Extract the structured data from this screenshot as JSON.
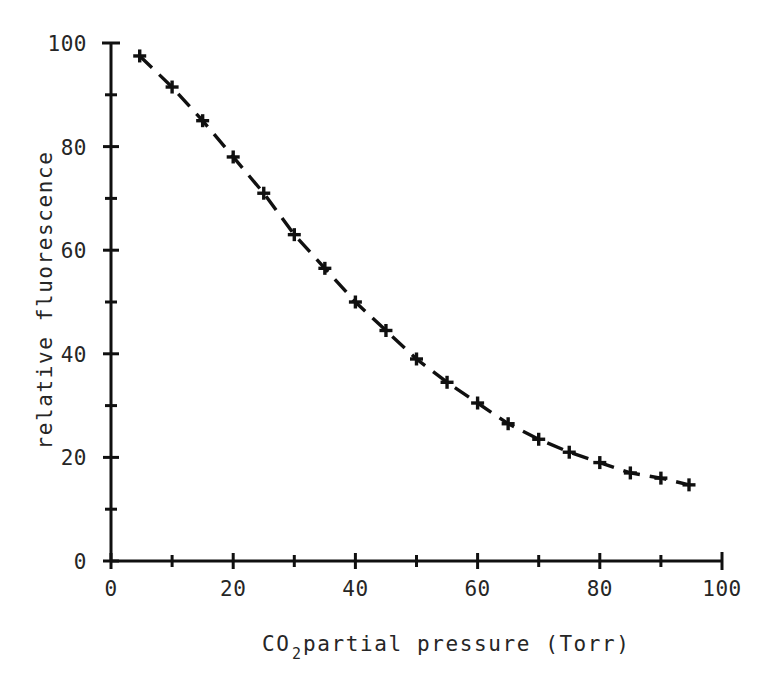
{
  "figure": {
    "background_color": "#ffffff",
    "ink_color": "#101010"
  },
  "chart_data": {
    "type": "line",
    "title": "",
    "subtitle": "",
    "xlabel": "CO2 partial pressure (Torr)",
    "xlabel_parts": {
      "base": "CO",
      "subscript": "2",
      "rest": " partial pressure  (Torr)"
    },
    "ylabel": "relative fluorescence",
    "xlim": [
      0,
      100
    ],
    "ylim": [
      0,
      100
    ],
    "grid": false,
    "legend": null,
    "legend_position": "none",
    "x_major_ticks": [
      0,
      20,
      40,
      60,
      80,
      100
    ],
    "x_major_tick_labels": [
      "0",
      "20",
      "40",
      "60",
      "80",
      "100"
    ],
    "x_minor_ticks": [
      10,
      30,
      50,
      70,
      90
    ],
    "y_major_ticks": [
      0,
      20,
      40,
      60,
      80,
      100
    ],
    "y_major_tick_labels": [
      "0",
      "20",
      "40",
      "60",
      "80",
      "100"
    ],
    "y_minor_ticks": [
      10,
      30,
      50,
      70,
      90
    ],
    "marker_style": "plus",
    "line_style": "dashed",
    "series": [
      {
        "name": "relative fluorescence",
        "x": [
          4.7,
          10.0,
          15.0,
          20.0,
          25.0,
          30.0,
          35.0,
          40.0,
          45.0,
          50.0,
          55.0,
          60.0,
          65.0,
          70.0,
          75.0,
          80.0,
          85.0,
          90.0,
          94.6
        ],
        "y": [
          97.5,
          91.5,
          85.0,
          78.0,
          71.0,
          63.0,
          56.5,
          50.0,
          44.5,
          39.0,
          34.5,
          30.5,
          26.5,
          23.5,
          21.0,
          19.0,
          17.0,
          16.0,
          14.7
        ]
      }
    ]
  },
  "geometry": {
    "plot_left_px": 111,
    "plot_right_px": 722,
    "plot_bottom_px": 561,
    "plot_top_px": 43
  }
}
